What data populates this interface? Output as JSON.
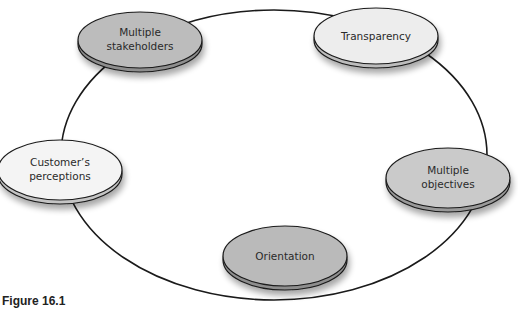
{
  "figure": {
    "caption": "Figure 16.1"
  },
  "diagram": {
    "type": "cycle",
    "ring": {
      "cx": 274,
      "cy": 155,
      "rx": 213,
      "ry": 145,
      "stroke": "#1a1a1a"
    },
    "nodes": [
      {
        "id": "multiple-stakeholders",
        "lines": [
          "Multiple",
          "stakeholders"
        ],
        "cx": 140,
        "cy": 40,
        "rx": 62,
        "ry": 28,
        "fill": "#b9b9b9"
      },
      {
        "id": "transparency",
        "lines": [
          "Transparency"
        ],
        "cx": 376,
        "cy": 36,
        "rx": 62,
        "ry": 28,
        "fill": "#ececec"
      },
      {
        "id": "multiple-objectives",
        "lines": [
          "Multiple",
          "objectives"
        ],
        "cx": 448,
        "cy": 178,
        "rx": 62,
        "ry": 30,
        "fill": "#c9c9c9"
      },
      {
        "id": "orientation",
        "lines": [
          "Orientation"
        ],
        "cx": 285,
        "cy": 256,
        "rx": 62,
        "ry": 30,
        "fill": "#b9b9b9"
      },
      {
        "id": "customers-perceptions",
        "lines": [
          "Customer’s",
          "perceptions"
        ],
        "cx": 60,
        "cy": 170,
        "rx": 62,
        "ry": 30,
        "fill": "#f4f4f4"
      }
    ]
  },
  "labels": {
    "n0l0": "Multiple",
    "n0l1": "stakeholders",
    "n1l0": "Transparency",
    "n2l0": "Multiple",
    "n2l1": "objectives",
    "n3l0": "Orientation",
    "n4l0": "Customer’s",
    "n4l1": "perceptions"
  }
}
